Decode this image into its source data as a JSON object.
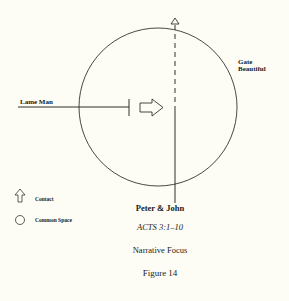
{
  "diagram": {
    "labels": {
      "left_actor": "Lame Man",
      "gate": [
        "Gate",
        "Beautiful"
      ],
      "bottom_actor": "Peter & John"
    },
    "caption": {
      "reference": "ACTS 3:1–10",
      "subtitle": "Narrative Focus",
      "figure": "Figure 14"
    },
    "legend": [
      {
        "icon": "up-arrow-icon",
        "label": "Contact"
      },
      {
        "icon": "circle-icon",
        "label": "Common Space"
      }
    ],
    "colors": {
      "background": "#fdfdf5",
      "stroke": "#1a1a1a"
    }
  }
}
